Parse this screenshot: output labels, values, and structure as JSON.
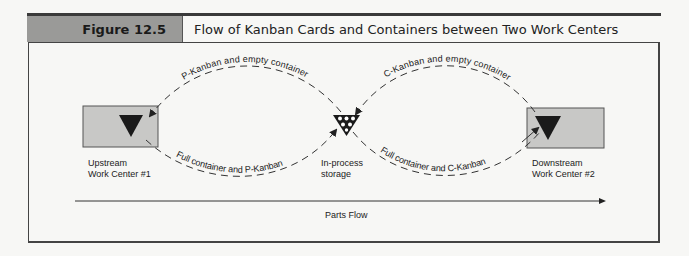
{
  "figure": {
    "number": "Figure 12.5",
    "title": "Flow of Kanban Cards and Containers between Two Work Centers"
  },
  "nodes": {
    "upstream": {
      "line1": "Upstream",
      "line2": "Work Center #1"
    },
    "storage": {
      "line1": "In-process",
      "line2": "storage"
    },
    "downstream": {
      "line1": "Downstream",
      "line2": "Work Center #2"
    }
  },
  "flows": {
    "p_kanban_return": "P-Kanban and empty container",
    "p_kanban_forward": "Full container and P-Kanban",
    "c_kanban_return": "C-Kanban and empty container",
    "c_kanban_forward": "Full container and C-Kanban"
  },
  "parts_flow": {
    "label": "Parts Flow"
  },
  "colors": {
    "label_band": "#9a9a98",
    "work_center_fill": "#c8c8c6",
    "triangle": "#1a1a1a",
    "line": "#333333"
  }
}
